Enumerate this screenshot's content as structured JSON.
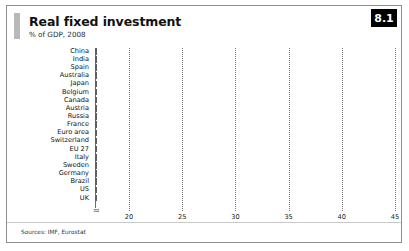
{
  "figure": {
    "badge": "8.1",
    "title": "Real fixed investment",
    "subtitle": "% of GDP, 2008",
    "source": "Sources: IMF, Eurostat",
    "accent_color": "#b9b9b9",
    "badge_bg": "#000000",
    "badge_fg": "#ffffff",
    "bar_fill": "#a6a6a6",
    "bar_stroke": "#5f5f5f",
    "frame_color": "#8e8e8e"
  },
  "chart_data": {
    "type": "bar",
    "orientation": "horizontal",
    "title": "Real fixed investment",
    "subtitle": "% of GDP, 2008",
    "xlabel": "",
    "ylabel": "",
    "xlim": [
      16.8,
      46.5
    ],
    "axis_break": true,
    "axis_break_symbol": "≈",
    "grid": "dotted-vertical",
    "legend": "none",
    "xticks": [
      20,
      25,
      30,
      35,
      40,
      45
    ],
    "xtick_labels": [
      "20",
      "25",
      "30",
      "35",
      "40",
      "45"
    ],
    "categories": [
      "China",
      "India",
      "Spain",
      "Australia",
      "Japan",
      "Belgium",
      "Canada",
      "Austria",
      "Russia",
      "France",
      "Euro area",
      "Switzerland",
      "EU 27",
      "Italy",
      "Sweden",
      "Germany",
      "Brazil",
      "US",
      "UK"
    ],
    "values": [
      42.2,
      34.8,
      29.2,
      28.9,
      23.7,
      23.5,
      23.3,
      22.9,
      22.5,
      22.1,
      21.9,
      21.6,
      21.4,
      21.2,
      19.5,
      19.0,
      18.5,
      18.2,
      16.9
    ],
    "source": "Sources: IMF, Eurostat"
  }
}
